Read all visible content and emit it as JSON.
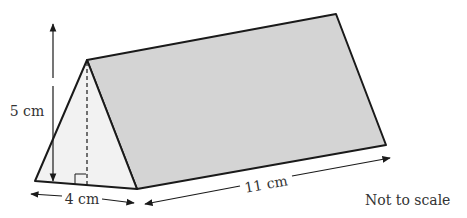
{
  "diagram": {
    "shape": "triangular prism",
    "labels": {
      "height": "5 cm",
      "base": "4 cm",
      "length": "11 cm",
      "note": "Not to scale"
    },
    "colors": {
      "face_shaded": "#d4d4d4",
      "face_front": "#f2f2f2",
      "stroke": "#1a1a1a",
      "text": "#333333"
    }
  }
}
